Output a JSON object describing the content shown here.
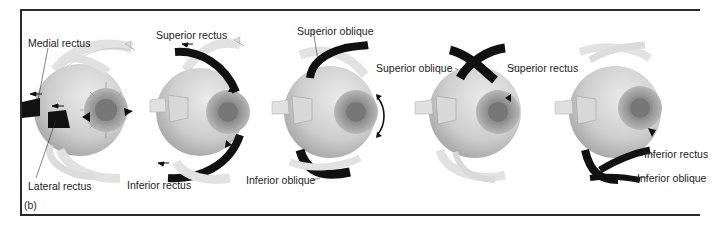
{
  "figure": {
    "panel_label": "(b)",
    "eyes": [
      {
        "id": "eye-1",
        "labels": [
          {
            "text": "Medial rectus"
          },
          {
            "text": "Lateral  rectus"
          }
        ]
      },
      {
        "id": "eye-2",
        "labels": [
          {
            "text": "Superior rectus"
          },
          {
            "text": "Inferior rectus"
          }
        ]
      },
      {
        "id": "eye-3",
        "labels": [
          {
            "text": "Superior oblique"
          },
          {
            "text": "Inferior oblique"
          }
        ]
      },
      {
        "id": "eye-4",
        "labels": [
          {
            "text": "Superior oblique"
          },
          {
            "text": "Superior rectus"
          }
        ]
      },
      {
        "id": "eye-5",
        "labels": [
          {
            "text": "Inferior rectus"
          },
          {
            "text": "Inferior oblique"
          }
        ]
      }
    ]
  },
  "colors": {
    "eyeball": "#cfcfcf",
    "iris": "#9a9a9a",
    "pupil": "#6e6e6e",
    "muscle_highlight": "#111111",
    "muscle_pale": "#e4e4e4",
    "frame": "#2a2a2a"
  }
}
